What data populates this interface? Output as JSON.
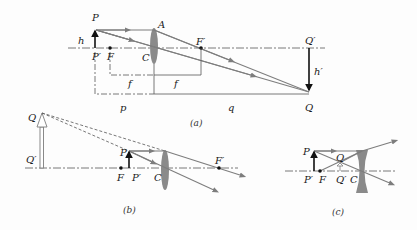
{
  "colors": {
    "ray": "#7d7d7d",
    "axis": "#555555",
    "object": "#111111",
    "lens": "#8a8a8a",
    "label": "#1a1a1a"
  },
  "diagram_a": {
    "caption": "(a)",
    "labels": {
      "object_top": "P",
      "object_base": "P′",
      "object_height": "h",
      "lens_top": "A",
      "lens_center": "C",
      "focal_front": "F",
      "focal_back": "F′",
      "image_base": "Q′",
      "image_top": "Q",
      "image_height": "h′",
      "focal_length_left": "f",
      "focal_length_right": "f",
      "object_distance": "p",
      "image_distance": "q"
    }
  },
  "diagram_b": {
    "caption": "(b)",
    "labels": {
      "virtual_image_top": "Q",
      "virtual_image_base": "Q′",
      "object_top": "P",
      "object_base": "P′",
      "focal_front": "F",
      "focal_back": "F′",
      "lens_center": "C"
    }
  },
  "diagram_c": {
    "caption": "(c)",
    "labels": {
      "object_top": "P",
      "object_base": "P′",
      "focal_front": "F",
      "virtual_image_top": "Q",
      "virtual_image_base": "Q′",
      "lens_center": "C"
    }
  }
}
